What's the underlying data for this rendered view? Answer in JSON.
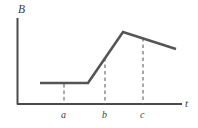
{
  "chart_data": {
    "type": "line",
    "title": "",
    "xlabel": "t",
    "ylabel": "B",
    "grid": false,
    "legend": null,
    "axes": {
      "x_axis_label": "t",
      "y_axis_label": "B",
      "x_tick_labels": [
        "a",
        "b",
        "c"
      ],
      "y_tick_labels": [],
      "origin_px": [
        17,
        104
      ],
      "x_axis_end_px": [
        182,
        104
      ],
      "y_axis_top_px": [
        17,
        18
      ]
    },
    "series": [
      {
        "name": "B(t)",
        "style": "solid",
        "color": "#555555",
        "points_px": [
          [
            40,
            83
          ],
          [
            88,
            83
          ],
          [
            123,
            32
          ],
          [
            176,
            49
          ]
        ],
        "description": "Flat low plateau, then steep linear rise, peak, then gradual linear decline"
      }
    ],
    "dashed_guides": [
      {
        "label": "a",
        "x_px": 64,
        "y_top_px": 84,
        "y_bottom_px": 104
      },
      {
        "label": "b",
        "x_px": 105,
        "y_top_px": 58,
        "y_bottom_px": 104
      },
      {
        "label": "c",
        "x_px": 143,
        "y_top_px": 38,
        "y_bottom_px": 104
      }
    ],
    "annotations": [],
    "colors": {
      "curve": "#555555",
      "axis": "#4a4a4a",
      "dashed": "#6e6e6e",
      "text": "#3d3d3d",
      "background": "#ffffff"
    }
  },
  "labels": {
    "y_axis": "B",
    "x_axis": "t",
    "tick_a": "a",
    "tick_b": "b",
    "tick_c": "c"
  }
}
